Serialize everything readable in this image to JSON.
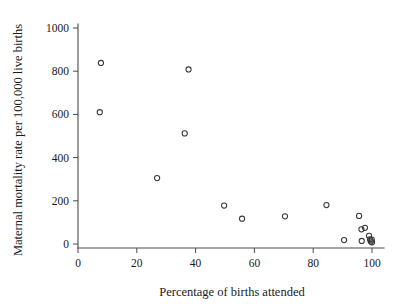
{
  "chart_data": {
    "type": "scatter",
    "title": "",
    "xlabel": "Percentage of births attended",
    "ylabel": "Maternal mortality rate per 100,000 live births",
    "xlim": [
      0,
      100
    ],
    "ylim": [
      0,
      1000
    ],
    "xticks": [
      0,
      20,
      40,
      60,
      80,
      100
    ],
    "yticks": [
      0,
      200,
      400,
      600,
      800,
      1000
    ],
    "xtick_labels": [
      "0",
      "20",
      "40",
      "60",
      "80",
      "100"
    ],
    "ytick_labels": [
      "0",
      "200",
      "400",
      "600",
      "800",
      "1000"
    ],
    "grid": false,
    "legend": null,
    "marker": "open-circle",
    "points": [
      {
        "x": 7.8,
        "y": 838
      },
      {
        "x": 7.4,
        "y": 610
      },
      {
        "x": 26.9,
        "y": 305
      },
      {
        "x": 36.3,
        "y": 512
      },
      {
        "x": 37.6,
        "y": 808
      },
      {
        "x": 49.7,
        "y": 178
      },
      {
        "x": 55.8,
        "y": 117
      },
      {
        "x": 70.4,
        "y": 128
      },
      {
        "x": 84.5,
        "y": 180
      },
      {
        "x": 90.5,
        "y": 18
      },
      {
        "x": 95.6,
        "y": 130
      },
      {
        "x": 96.4,
        "y": 68
      },
      {
        "x": 97.6,
        "y": 75
      },
      {
        "x": 96.5,
        "y": 14
      },
      {
        "x": 99.0,
        "y": 38
      },
      {
        "x": 99.3,
        "y": 22
      },
      {
        "x": 99.6,
        "y": 12
      },
      {
        "x": 99.9,
        "y": 20
      },
      {
        "x": 100.0,
        "y": 8
      }
    ]
  },
  "axes": {
    "x_title": "Percentage of births attended",
    "y_title": "Maternal mortality rate per 100,000 live births"
  }
}
